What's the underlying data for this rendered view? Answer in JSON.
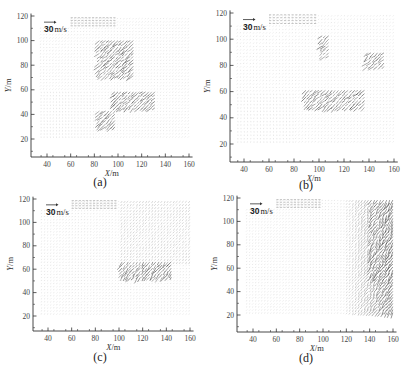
{
  "figure": {
    "reference_arrow_label_value": "30",
    "reference_arrow_label_unit": "m/s"
  },
  "chart_data": [
    {
      "id": "a",
      "type": "scatter",
      "subtype": "vector-field",
      "caption": "(a)",
      "xlabel": "X/m",
      "ylabel": "Y/m",
      "xlim": [
        30,
        163
      ],
      "ylim": [
        5,
        122
      ],
      "xticks": [
        40,
        60,
        80,
        100,
        120,
        140,
        160
      ],
      "yticks": [
        20,
        40,
        60,
        80,
        100,
        120
      ],
      "legend": "30 m/s reference vector",
      "grid": false,
      "annotations": [
        "30 m/s"
      ],
      "field_extent": {
        "x": [
          35,
          160
        ],
        "y": [
          22,
          120
        ]
      },
      "high_velocity_regions": [
        {
          "x": [
            95,
            132
          ],
          "y": [
            45,
            60
          ],
          "note": "dark shear band, max near (130,55)"
        },
        {
          "x": [
            84,
            115
          ],
          "y": [
            70,
            100
          ],
          "note": "streaks"
        },
        {
          "x": [
            84,
            98
          ],
          "y": [
            28,
            45
          ],
          "note": "dense vectors"
        }
      ]
    },
    {
      "id": "b",
      "type": "scatter",
      "subtype": "vector-field",
      "caption": "(b)",
      "xlabel": "X/m",
      "ylabel": "Y/m",
      "xlim": [
        30,
        163
      ],
      "ylim": [
        5,
        122
      ],
      "xticks": [
        40,
        60,
        80,
        100,
        120,
        140,
        160
      ],
      "yticks": [
        20,
        40,
        60,
        80,
        100,
        120
      ],
      "legend": "30 m/s reference vector",
      "grid": false,
      "annotations": [
        "30 m/s"
      ],
      "field_extent": {
        "x": [
          35,
          162
        ],
        "y": [
          22,
          120
        ]
      },
      "high_velocity_regions": [
        {
          "x": [
            88,
            138
          ],
          "y": [
            48,
            62
          ],
          "note": "dark band, max near (132,55)"
        },
        {
          "x": [
            100,
            108
          ],
          "y": [
            85,
            105
          ],
          "note": "streak"
        },
        {
          "x": [
            138,
            152
          ],
          "y": [
            78,
            90
          ],
          "note": "streak"
        }
      ]
    },
    {
      "id": "c",
      "type": "scatter",
      "subtype": "vector-field",
      "caption": "(c)",
      "xlabel": "X/m",
      "ylabel": "Y/m",
      "xlim": [
        30,
        163
      ],
      "ylim": [
        5,
        122
      ],
      "xticks": [
        40,
        60,
        80,
        100,
        120,
        140,
        160
      ],
      "yticks": [
        20,
        40,
        60,
        80,
        100,
        120
      ],
      "legend": "30 m/s reference vector",
      "grid": false,
      "annotations": [
        "30 m/s"
      ],
      "field_extent": {
        "x": [
          35,
          160
        ],
        "y": [
          22,
          120
        ]
      },
      "high_velocity_regions": [
        {
          "x": [
            100,
            145
          ],
          "y": [
            52,
            68
          ],
          "note": "dark band, max near (138,58)"
        }
      ]
    },
    {
      "id": "d",
      "type": "scatter",
      "subtype": "vector-field",
      "caption": "(d)",
      "xlabel": "X/m",
      "ylabel": "Y/m",
      "xlim": [
        30,
        163
      ],
      "ylim": [
        5,
        122
      ],
      "xticks": [
        40,
        60,
        80,
        100,
        120,
        140,
        160
      ],
      "yticks": [
        20,
        40,
        60,
        80,
        100,
        120
      ],
      "legend": "30 m/s reference vector",
      "grid": false,
      "annotations": [
        "30 m/s"
      ],
      "field_extent": {
        "x": [
          35,
          162
        ],
        "y": [
          22,
          120
        ]
      },
      "high_velocity_regions": [
        {
          "x": [
            140,
            162
          ],
          "y": [
            50,
            120
          ],
          "note": "dark diagonal streaks, max near (155,58)"
        }
      ]
    }
  ],
  "panels": {
    "a": {
      "caption": "(a)",
      "xlabel_var": "X",
      "xlabel_unit": "/m",
      "ylabel_var": "Y",
      "ylabel_unit": "/m"
    },
    "b": {
      "caption": "(b)",
      "xlabel_var": "X",
      "xlabel_unit": "/m",
      "ylabel_var": "Y",
      "ylabel_unit": "/m"
    },
    "c": {
      "caption": "(c)",
      "xlabel_var": "X",
      "xlabel_unit": "/m",
      "ylabel_var": "Y",
      "ylabel_unit": "/m"
    },
    "d": {
      "caption": "(d)",
      "xlabel_var": "X",
      "xlabel_unit": "/m",
      "ylabel_var": "Y",
      "ylabel_unit": "/m"
    }
  },
  "layout": {
    "a": {
      "ox": 31,
      "axisY": 157,
      "x40": 47,
      "x160": 189,
      "y20": 139,
      "y120": 16
    },
    "b": {
      "ox": 230,
      "axisY": 162,
      "x40": 244,
      "x160": 394,
      "y20": 144,
      "y120": 13
    },
    "c": {
      "ox": 33,
      "axisY": 331,
      "x40": 48,
      "x160": 190,
      "y20": 316,
      "y120": 199
    },
    "d": {
      "ox": 237,
      "axisY": 332,
      "x40": 253,
      "x160": 393,
      "y20": 315,
      "y120": 198
    }
  }
}
